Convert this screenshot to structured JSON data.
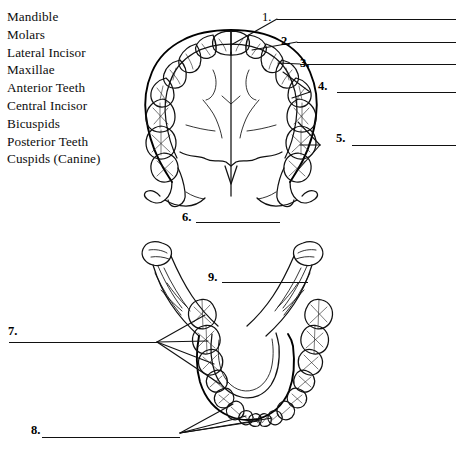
{
  "worksheet": {
    "title": "Dental Anatomy Labeling Worksheet",
    "ink_color": "#111111",
    "paper_color": "#ffffff"
  },
  "word_bank": {
    "name": "word-bank",
    "terms": [
      "Mandible",
      "Molars",
      "Lateral Incisor",
      "Maxillae",
      "Anterior Teeth",
      "Central Incisor",
      "Bicuspids",
      "Posterior Teeth",
      "Cuspids (Canine)"
    ]
  },
  "diagrams": [
    {
      "name": "maxilla-occlusal-view",
      "caption": "Upper jaw (maxillae) seen from below, full dental arch"
    },
    {
      "name": "mandible-occlusal-view",
      "caption": "Lower jaw (mandible) seen from above, full dental arch"
    }
  ],
  "answer_blanks": [
    {
      "number": "1.",
      "value": ""
    },
    {
      "number": "2.",
      "value": ""
    },
    {
      "number": "3.",
      "value": ""
    },
    {
      "number": "4.",
      "value": ""
    },
    {
      "number": "5.",
      "value": ""
    },
    {
      "number": "6.",
      "value": ""
    },
    {
      "number": "7.",
      "value": ""
    },
    {
      "number": "8.",
      "value": ""
    },
    {
      "number": "9.",
      "value": ""
    }
  ]
}
